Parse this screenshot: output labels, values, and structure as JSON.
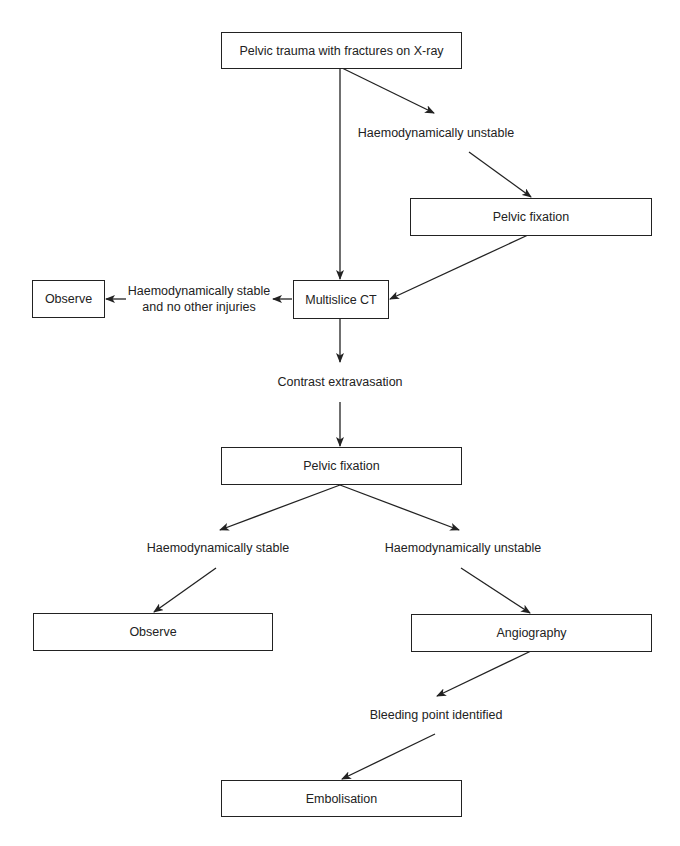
{
  "diagram": {
    "type": "flowchart",
    "nodes": {
      "start": "Pelvic trauma with fractures on X-ray",
      "unstable_1": "Haemodynamically unstable",
      "pelvic_fixation_1": "Pelvic fixation",
      "multislice_ct": "Multislice CT",
      "stable_no_injuries_line1": "Haemodynamically stable",
      "stable_no_injuries_line2": "and no other injuries",
      "observe_1": "Observe",
      "contrast_extravasation": "Contrast extravasation",
      "pelvic_fixation_2": "Pelvic fixation",
      "stable_2": "Haemodynamically stable",
      "unstable_2": "Haemodynamically unstable",
      "observe_2": "Observe",
      "angiography": "Angiography",
      "bleeding_point": "Bleeding point identified",
      "embolisation": "Embolisation"
    },
    "edges": [
      {
        "from": "start",
        "to": "multislice_ct"
      },
      {
        "from": "start",
        "to": "unstable_1"
      },
      {
        "from": "unstable_1",
        "to": "pelvic_fixation_1"
      },
      {
        "from": "pelvic_fixation_1",
        "to": "multislice_ct"
      },
      {
        "from": "multislice_ct",
        "to": "stable_no_injuries"
      },
      {
        "from": "stable_no_injuries",
        "to": "observe_1"
      },
      {
        "from": "multislice_ct",
        "to": "contrast_extravasation"
      },
      {
        "from": "contrast_extravasation",
        "to": "pelvic_fixation_2"
      },
      {
        "from": "pelvic_fixation_2",
        "to": "stable_2"
      },
      {
        "from": "pelvic_fixation_2",
        "to": "unstable_2"
      },
      {
        "from": "stable_2",
        "to": "observe_2"
      },
      {
        "from": "unstable_2",
        "to": "angiography"
      },
      {
        "from": "angiography",
        "to": "bleeding_point"
      },
      {
        "from": "bleeding_point",
        "to": "embolisation"
      }
    ],
    "line_color": "#222222"
  }
}
